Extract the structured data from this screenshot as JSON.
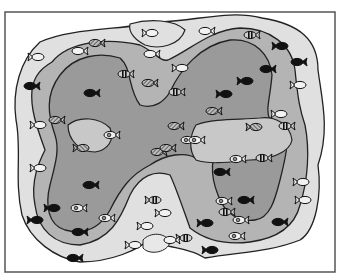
{
  "figure": {
    "frame": {
      "x": 5,
      "y": 12,
      "w": 330,
      "h": 260
    },
    "colors": {
      "background": "#ffffff",
      "frame": "#555555",
      "outer_zone": "#e0e0e0",
      "middle_zone": "#b4b4b4",
      "inner_zone": "#9a9a9a",
      "outline": "#222222",
      "fish_solid": "#111111",
      "fish_hatched": "#888888",
      "fish_open": "#f2f2f2"
    },
    "zones": [
      "outer",
      "middle",
      "inner"
    ],
    "fish_types": [
      "solid",
      "hatched",
      "open",
      "open-eye",
      "banded"
    ],
    "fish": [
      {
        "x": 95,
        "y": 43,
        "type": "hatched",
        "dir": 1
      },
      {
        "x": 78,
        "y": 51,
        "type": "open",
        "dir": 1
      },
      {
        "x": 38,
        "y": 57,
        "type": "open",
        "dir": -1
      },
      {
        "x": 152,
        "y": 33,
        "type": "open",
        "dir": -1
      },
      {
        "x": 150,
        "y": 54,
        "type": "open",
        "dir": 1
      },
      {
        "x": 124,
        "y": 74,
        "type": "banded",
        "dir": 1
      },
      {
        "x": 148,
        "y": 83,
        "type": "hatched",
        "dir": 1
      },
      {
        "x": 30,
        "y": 86,
        "type": "solid",
        "dir": 1
      },
      {
        "x": 90,
        "y": 93,
        "type": "solid",
        "dir": 1
      },
      {
        "x": 55,
        "y": 120,
        "type": "hatched",
        "dir": 1
      },
      {
        "x": 40,
        "y": 125,
        "type": "open",
        "dir": -1
      },
      {
        "x": 110,
        "y": 135,
        "type": "open-eye",
        "dir": 1
      },
      {
        "x": 205,
        "y": 31,
        "type": "open",
        "dir": 1
      },
      {
        "x": 250,
        "y": 35,
        "type": "banded",
        "dir": 1
      },
      {
        "x": 282,
        "y": 46,
        "type": "solid",
        "dir": -1
      },
      {
        "x": 297,
        "y": 62,
        "type": "solid",
        "dir": 1
      },
      {
        "x": 300,
        "y": 85,
        "type": "open",
        "dir": -1
      },
      {
        "x": 266,
        "y": 69,
        "type": "solid",
        "dir": 1
      },
      {
        "x": 247,
        "y": 81,
        "type": "solid",
        "dir": -1
      },
      {
        "x": 226,
        "y": 94,
        "type": "solid",
        "dir": -1
      },
      {
        "x": 182,
        "y": 68,
        "type": "open",
        "dir": -1
      },
      {
        "x": 175,
        "y": 92,
        "type": "banded",
        "dir": 1
      },
      {
        "x": 212,
        "y": 111,
        "type": "hatched",
        "dir": 1
      },
      {
        "x": 256,
        "y": 127,
        "type": "hatched",
        "dir": -1
      },
      {
        "x": 281,
        "y": 114,
        "type": "open",
        "dir": -1
      },
      {
        "x": 285,
        "y": 126,
        "type": "banded",
        "dir": 1
      },
      {
        "x": 174,
        "y": 126,
        "type": "hatched",
        "dir": 1
      },
      {
        "x": 187,
        "y": 140,
        "type": "open-eye",
        "dir": 1
      },
      {
        "x": 157,
        "y": 152,
        "type": "hatched",
        "dir": 1
      },
      {
        "x": 236,
        "y": 159,
        "type": "open-eye",
        "dir": 1
      },
      {
        "x": 83,
        "y": 148,
        "type": "hatched",
        "dir": -1
      },
      {
        "x": 166,
        "y": 148,
        "type": "hatched",
        "dir": 1
      },
      {
        "x": 195,
        "y": 140,
        "type": "open-eye",
        "dir": 1
      },
      {
        "x": 220,
        "y": 172,
        "type": "solid",
        "dir": 1
      },
      {
        "x": 262,
        "y": 158,
        "type": "banded",
        "dir": 1
      },
      {
        "x": 303,
        "y": 182,
        "type": "open",
        "dir": -1
      },
      {
        "x": 305,
        "y": 200,
        "type": "open",
        "dir": -1
      },
      {
        "x": 40,
        "y": 168,
        "type": "open",
        "dir": -1
      },
      {
        "x": 89,
        "y": 185,
        "type": "solid",
        "dir": 1
      },
      {
        "x": 54,
        "y": 208,
        "type": "solid",
        "dir": -1
      },
      {
        "x": 77,
        "y": 208,
        "type": "open-eye",
        "dir": 1
      },
      {
        "x": 105,
        "y": 218,
        "type": "open-eye",
        "dir": 1
      },
      {
        "x": 37,
        "y": 220,
        "type": "solid",
        "dir": -1
      },
      {
        "x": 78,
        "y": 232,
        "type": "solid",
        "dir": 1
      },
      {
        "x": 155,
        "y": 200,
        "type": "banded",
        "dir": -1
      },
      {
        "x": 147,
        "y": 226,
        "type": "open",
        "dir": -1
      },
      {
        "x": 165,
        "y": 213,
        "type": "open",
        "dir": -1
      },
      {
        "x": 222,
        "y": 201,
        "type": "open-eye",
        "dir": 1
      },
      {
        "x": 225,
        "y": 212,
        "type": "banded",
        "dir": 1
      },
      {
        "x": 244,
        "y": 200,
        "type": "solid",
        "dir": 1
      },
      {
        "x": 239,
        "y": 220,
        "type": "open-eye",
        "dir": 1
      },
      {
        "x": 235,
        "y": 236,
        "type": "open-eye",
        "dir": 1
      },
      {
        "x": 207,
        "y": 223,
        "type": "solid",
        "dir": -1
      },
      {
        "x": 278,
        "y": 222,
        "type": "solid",
        "dir": 1
      },
      {
        "x": 212,
        "y": 250,
        "type": "solid",
        "dir": -1
      },
      {
        "x": 73,
        "y": 258,
        "type": "solid",
        "dir": 1
      },
      {
        "x": 135,
        "y": 245,
        "type": "open",
        "dir": -1
      },
      {
        "x": 186,
        "y": 238,
        "type": "banded",
        "dir": -1
      },
      {
        "x": 170,
        "y": 240,
        "type": "open",
        "dir": 1
      }
    ]
  }
}
